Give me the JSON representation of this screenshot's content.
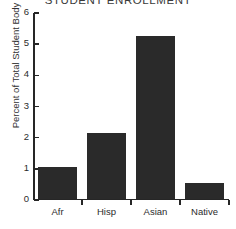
{
  "chart_data": {
    "type": "bar",
    "title": "STUDENT ENROLLMENT",
    "xlabel": "",
    "ylabel": "Percent of Total Student Body",
    "categories": [
      "Afr",
      "Hisp",
      "Asian",
      "Native"
    ],
    "values": [
      1.0,
      2.1,
      5.2,
      0.5
    ],
    "ylim": [
      0,
      6
    ],
    "yticks": [
      0,
      1,
      2,
      3,
      4,
      5,
      6
    ],
    "ytick_labels": [
      "0",
      "1",
      "2",
      "3",
      "4",
      "5",
      "6"
    ],
    "grid": false,
    "legend": null,
    "bar_color": "#2a2a2a",
    "axis_color": "#262626",
    "background_color": "#ffffff"
  }
}
